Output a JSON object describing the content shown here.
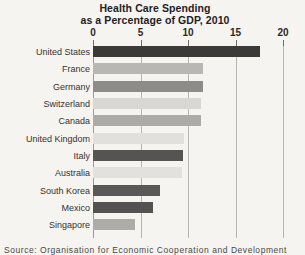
{
  "chart_data": {
    "type": "bar",
    "orientation": "horizontal",
    "title": "Health Care Spending as a Percentage of GDP, 2010",
    "title_line1": "Health Care Spending",
    "title_line2": "as a Percentage of GDP, 2010",
    "xlabel": "",
    "ylabel": "",
    "xlim": [
      0,
      20
    ],
    "grid": true,
    "legend": "none",
    "tick_labels": [
      "0",
      "5",
      "10",
      "15",
      "20"
    ],
    "ticks": [
      0,
      5,
      10,
      15,
      20
    ],
    "categories": [
      "United States",
      "France",
      "Germany",
      "Switzerland",
      "Canada",
      "United Kingdom",
      "Italy",
      "Australia",
      "South Korea",
      "Mexico",
      "Singapore"
    ],
    "values": [
      17.6,
      11.6,
      11.6,
      11.4,
      11.4,
      9.6,
      9.5,
      9.4,
      7.1,
      6.3,
      4.4
    ],
    "bar_colors": [
      "#3b3a38",
      "#b9b7b4",
      "#8e8c89",
      "#d9d7d4",
      "#adaba8",
      "#e2e0dd",
      "#565452",
      "#e3e1de",
      "#5a5856",
      "#545250",
      "#aeaca9"
    ],
    "annotations": []
  },
  "source": {
    "note": "Source: Organisation for Economic Cooperation and Development"
  }
}
